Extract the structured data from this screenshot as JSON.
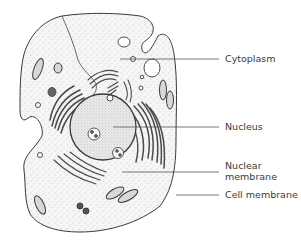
{
  "diagram": {
    "colors": {
      "outline": "#3a3a3a",
      "cytoplasm_fill": "#f3f3f3",
      "nucleus_fill": "#e6e6e6",
      "organelle_dark": "#555555",
      "leader_line": "#555555",
      "label_text": "#3a3a3a"
    },
    "labels": [
      {
        "id": "cytoplasm",
        "text": "Cytoplasm",
        "line_y": 59,
        "line_x1": 120,
        "line_x2": 219,
        "text_x": 225,
        "text_y": 53
      },
      {
        "id": "nucleus",
        "text": "Nucleus",
        "line_y": 127,
        "line_x1": 113,
        "line_x2": 219,
        "text_x": 225,
        "text_y": 121
      },
      {
        "id": "nuclear-membrane",
        "text_line1": "Nuclear",
        "text_line2": "membrane",
        "line_y": 172,
        "line_x1": 122,
        "line_x2": 219,
        "text_x": 225,
        "text_y": 160
      },
      {
        "id": "cell-membrane",
        "text": "Cell membrane",
        "line_y": 195,
        "line_x1": 176,
        "line_x2": 219,
        "text_x": 225,
        "text_y": 189
      }
    ]
  }
}
